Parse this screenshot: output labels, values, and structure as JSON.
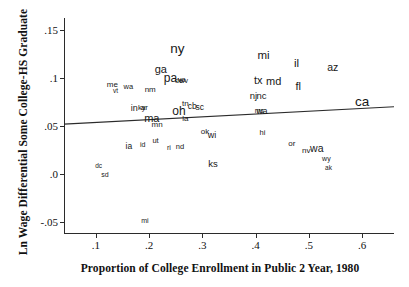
{
  "chart_data": {
    "type": "scatter",
    "title": "",
    "xlabel": "Proportion of College Enrollment in Public 2 Year, 1980",
    "ylabel": "Ln Wage Differential Some College-HS Graduate",
    "xlim": [
      0.04,
      0.66
    ],
    "ylim": [
      -0.062,
      0.163
    ],
    "xticks": [
      0.1,
      0.2,
      0.3,
      0.4,
      0.5,
      0.6
    ],
    "xticklabels": [
      ".1",
      ".2",
      ".3",
      ".4",
      ".5",
      ".6"
    ],
    "yticks": [
      -0.05,
      0.0,
      0.05,
      0.1,
      0.15
    ],
    "yticklabels": [
      "-.05",
      ".0",
      ".05",
      ".1",
      ".15"
    ],
    "grid": false,
    "legend": false,
    "marker_style": "state-abbreviation-text",
    "fit_line": {
      "label": "linear fit",
      "x": [
        0.04,
        0.66
      ],
      "y": [
        0.0525,
        0.0705
      ]
    },
    "points": [
      {
        "label": "ny",
        "x": 0.253,
        "y": 0.131,
        "size": 13.5
      },
      {
        "label": "mi",
        "x": 0.415,
        "y": 0.123,
        "size": 11.5
      },
      {
        "label": "il",
        "x": 0.477,
        "y": 0.115,
        "size": 11.5
      },
      {
        "label": "az",
        "x": 0.545,
        "y": 0.112,
        "size": 10.5
      },
      {
        "label": "ga",
        "x": 0.222,
        "y": 0.11,
        "size": 11.0
      },
      {
        "label": "pa",
        "x": 0.24,
        "y": 0.101,
        "size": 12.0
      },
      {
        "label": "de",
        "x": 0.256,
        "y": 0.098,
        "size": 7.0
      },
      {
        "label": "va",
        "x": 0.261,
        "y": 0.098,
        "size": 7.5
      },
      {
        "label": "wv",
        "x": 0.265,
        "y": 0.098,
        "size": 7.0
      },
      {
        "label": "tx",
        "x": 0.405,
        "y": 0.098,
        "size": 11.0
      },
      {
        "label": "md",
        "x": 0.434,
        "y": 0.097,
        "size": 11.0
      },
      {
        "label": "fl",
        "x": 0.48,
        "y": 0.092,
        "size": 11.0
      },
      {
        "label": "me",
        "x": 0.131,
        "y": 0.093,
        "size": 8.0
      },
      {
        "label": "wa",
        "x": 0.161,
        "y": 0.091,
        "size": 7.5
      },
      {
        "label": "vt",
        "x": 0.137,
        "y": 0.087,
        "size": 6.5
      },
      {
        "label": "nm",
        "x": 0.202,
        "y": 0.088,
        "size": 8.0
      },
      {
        "label": "nj",
        "x": 0.396,
        "y": 0.082,
        "size": 9.5
      },
      {
        "label": "nc",
        "x": 0.411,
        "y": 0.082,
        "size": 9.5
      },
      {
        "label": "ca",
        "x": 0.6,
        "y": 0.075,
        "size": 13.5
      },
      {
        "label": "tn",
        "x": 0.268,
        "y": 0.073,
        "size": 8.0
      },
      {
        "label": "cb",
        "x": 0.281,
        "y": 0.071,
        "size": 8.5
      },
      {
        "label": "sc",
        "x": 0.295,
        "y": 0.07,
        "size": 8.5
      },
      {
        "label": "oh",
        "x": 0.256,
        "y": 0.066,
        "size": 12.0
      },
      {
        "label": "in",
        "x": 0.172,
        "y": 0.069,
        "size": 9.0
      },
      {
        "label": "ky",
        "x": 0.186,
        "y": 0.069,
        "size": 7.5
      },
      {
        "label": "ar",
        "x": 0.191,
        "y": 0.069,
        "size": 8.0
      },
      {
        "label": "ms",
        "x": 0.407,
        "y": 0.067,
        "size": 7.0
      },
      {
        "label": "wa",
        "x": 0.412,
        "y": 0.066,
        "size": 8.5
      },
      {
        "label": "ma",
        "x": 0.205,
        "y": 0.059,
        "size": 11.0
      },
      {
        "label": "la",
        "x": 0.268,
        "y": 0.058,
        "size": 8.0
      },
      {
        "label": "mn",
        "x": 0.215,
        "y": 0.052,
        "size": 8.0
      },
      {
        "label": "ok",
        "x": 0.305,
        "y": 0.044,
        "size": 8.0
      },
      {
        "label": "wi",
        "x": 0.318,
        "y": 0.041,
        "size": 9.0
      },
      {
        "label": "hi",
        "x": 0.413,
        "y": 0.043,
        "size": 7.5
      },
      {
        "label": "ut",
        "x": 0.212,
        "y": 0.035,
        "size": 7.5
      },
      {
        "label": "ia",
        "x": 0.162,
        "y": 0.03,
        "size": 8.5
      },
      {
        "label": "id",
        "x": 0.188,
        "y": 0.032,
        "size": 7.0
      },
      {
        "label": "ri",
        "x": 0.237,
        "y": 0.029,
        "size": 7.0
      },
      {
        "label": "nd",
        "x": 0.258,
        "y": 0.029,
        "size": 7.5
      },
      {
        "label": "or",
        "x": 0.468,
        "y": 0.032,
        "size": 8.0
      },
      {
        "label": "wa",
        "x": 0.515,
        "y": 0.028,
        "size": 10.5
      },
      {
        "label": "nv",
        "x": 0.495,
        "y": 0.024,
        "size": 8.0
      },
      {
        "label": "wy",
        "x": 0.533,
        "y": 0.017,
        "size": 7.0
      },
      {
        "label": "ak",
        "x": 0.537,
        "y": 0.007,
        "size": 6.5
      },
      {
        "label": "ks",
        "x": 0.32,
        "y": 0.011,
        "size": 9.5
      },
      {
        "label": "dc",
        "x": 0.105,
        "y": 0.009,
        "size": 6.5
      },
      {
        "label": "sd",
        "x": 0.117,
        "y": 0.0,
        "size": 7.0
      },
      {
        "label": "mi",
        "x": 0.192,
        "y": -0.047,
        "size": 7.0
      }
    ]
  }
}
